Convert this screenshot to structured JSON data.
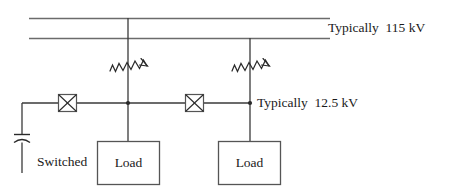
{
  "diagram": {
    "colors": {
      "bus_line": "#6b6b6b",
      "conductor": "#3a3a3a",
      "symbol_stroke": "#2a2a2a",
      "box_stroke": "#555555",
      "text": "#1a1a1a",
      "background": "#ffffff"
    },
    "labels": {
      "high_voltage": "Typically  115 kV",
      "medium_voltage": "Typically  12.5 kV",
      "switched_caps_line1": "Switched",
      "switched_caps_line2": "caps",
      "load_1": "Load",
      "load_2": "Load"
    },
    "symbols": {
      "transformer_1": "transformer-zigzag-icon",
      "transformer_2": "transformer-zigzag-icon",
      "breaker_1": "circuit-breaker-x-box-icon",
      "breaker_2": "circuit-breaker-x-box-icon",
      "capacitor": "capacitor-icon",
      "node_1": "junction-node-icon",
      "node_2": "junction-node-icon"
    },
    "buses": [
      {
        "name": "hv-bus-upper",
        "voltage": "115 kV"
      },
      {
        "name": "hv-bus-lower",
        "voltage": "115 kV"
      },
      {
        "name": "mv-bus",
        "voltage": "12.5 kV"
      }
    ]
  }
}
